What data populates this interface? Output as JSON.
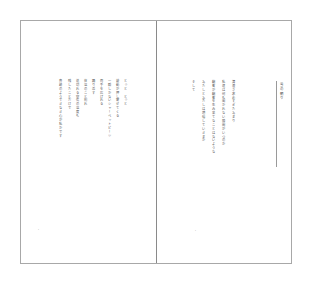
{
  "book": {
    "left_page": {
      "page_number": "・",
      "lines": [
        "とっと　とっと",
        "鼓動が押し寄せてくる",
        "一瞬しかないシャーベットビーツ",
        "両手を広げれる",
        "踊り返す",
        "体温のこと別れ",
        "途切れる空気の温度も",
        "残したことだけで",
        "奇跡のようできなき心が私かです"
      ]
    },
    "right_page": {
      "page_number": "・",
      "title": "雪の朝り",
      "lines": [
        "清澄さ求めすぎたあまり",
        "私達は何も聞かれない隙間がいつのか",
        "顧客が顧客を生み果てなことはないような",
        "あたしとあたしは増幅していきまか",
        "そして"
      ]
    }
  }
}
